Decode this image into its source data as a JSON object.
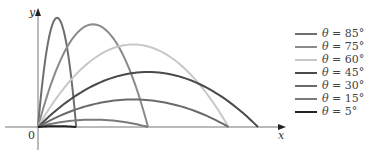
{
  "figure": {
    "x_label": "x",
    "y_label": "y",
    "origin_label": "0"
  },
  "legend": {
    "items": [
      {
        "symbol": "θ",
        "eq": " = ",
        "value": "85°",
        "color": "#6e6e6e"
      },
      {
        "symbol": "θ",
        "eq": " = ",
        "value": "75°",
        "color": "#8a8a8a"
      },
      {
        "symbol": "θ",
        "eq": " = ",
        "value": "60°",
        "color": "#c8c8c8"
      },
      {
        "symbol": "θ",
        "eq": " = ",
        "value": "45°",
        "color": "#4a4a4a"
      },
      {
        "symbol": "θ",
        "eq": " = ",
        "value": "30°",
        "color": "#6a6a6a"
      },
      {
        "symbol": "θ",
        "eq": " = ",
        "value": "15°",
        "color": "#7a7a7a"
      },
      {
        "symbol": "θ",
        "eq": " = ",
        "value": "5°",
        "color": "#222222"
      }
    ]
  },
  "chart_data": {
    "type": "line",
    "title": "",
    "xlabel": "x",
    "ylabel": "y",
    "grid": false,
    "legend_position": "right",
    "series": [
      {
        "name": "θ = 85°",
        "angle_deg": 85,
        "relative_range": 0.17,
        "relative_max_height": 0.99,
        "color": "#6e6e6e"
      },
      {
        "name": "θ = 75°",
        "angle_deg": 75,
        "relative_range": 0.5,
        "relative_max_height": 0.93,
        "color": "#8a8a8a"
      },
      {
        "name": "θ = 60°",
        "angle_deg": 60,
        "relative_range": 0.87,
        "relative_max_height": 0.75,
        "color": "#c8c8c8"
      },
      {
        "name": "θ = 45°",
        "angle_deg": 45,
        "relative_range": 1.0,
        "relative_max_height": 0.5,
        "color": "#4a4a4a"
      },
      {
        "name": "θ = 30°",
        "angle_deg": 30,
        "relative_range": 0.87,
        "relative_max_height": 0.25,
        "color": "#6a6a6a"
      },
      {
        "name": "θ = 15°",
        "angle_deg": 15,
        "relative_range": 0.5,
        "relative_max_height": 0.07,
        "color": "#7a7a7a"
      },
      {
        "name": "θ = 5°",
        "angle_deg": 5,
        "relative_range": 0.17,
        "relative_max_height": 0.008,
        "color": "#222222"
      }
    ]
  }
}
